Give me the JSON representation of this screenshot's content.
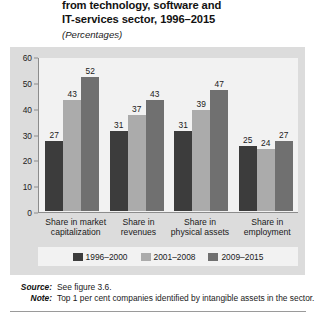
{
  "figure": {
    "title_lines": [
      "from technology, software and",
      "IT-services sector, 1996–2015"
    ],
    "subtitle": "(Percentages)"
  },
  "footnotes": {
    "source_label": "Source:",
    "source_text": "See figure 3.6.",
    "note_label": "Note:",
    "note_text": "Top 1 per cent companies identified by intangible assets in the sector."
  },
  "colors": {
    "series_1": "#3c3c3c",
    "series_2": "#ababab",
    "series_3": "#707070",
    "panel_background": "#dcdcdc",
    "plot_background": "#f2f2f2",
    "axis_line": "#8c8c8c"
  },
  "chart_data": {
    "type": "bar",
    "title": "from technology, software and IT-services sector, 1996–2015",
    "subtitle": "(Percentages)",
    "xlabel": "",
    "ylabel": "",
    "ylim": [
      0,
      60
    ],
    "yticks": [
      0,
      10,
      20,
      30,
      40,
      50,
      60
    ],
    "grid": false,
    "legend_position": "bottom",
    "categories": [
      "Share in market capitalization",
      "Share in revenues",
      "Share in physical assets",
      "Share in employment"
    ],
    "category_lines": [
      [
        "Share in market",
        "capitalization"
      ],
      [
        "Share in",
        "revenues"
      ],
      [
        "Share in",
        "physical assets"
      ],
      [
        "Share in",
        "employment"
      ]
    ],
    "series": [
      {
        "name": "1996–2000",
        "color": "#3c3c3c",
        "values": [
          27,
          31,
          31,
          25
        ]
      },
      {
        "name": "2001–2008",
        "color": "#ababab",
        "values": [
          43,
          37,
          39,
          24
        ]
      },
      {
        "name": "2009–2015",
        "color": "#707070",
        "values": [
          52,
          43,
          47,
          27
        ]
      }
    ]
  }
}
